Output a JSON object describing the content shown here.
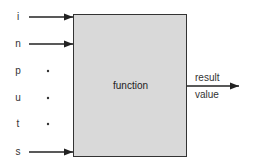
{
  "diagram": {
    "inputs": [
      {
        "label": "i",
        "y": 17,
        "arrow": true
      },
      {
        "label": "n",
        "y": 44,
        "arrow": true
      },
      {
        "label": "p",
        "y": 71,
        "arrow": false
      },
      {
        "label": "u",
        "y": 98,
        "arrow": false
      },
      {
        "label": "t",
        "y": 124,
        "arrow": false
      },
      {
        "label": "s",
        "y": 152,
        "arrow": true
      }
    ],
    "box_label": "function",
    "output": {
      "line1": "result",
      "line2": "value"
    },
    "colors": {
      "box_fill": "#d9d9d9",
      "stroke": "#222222"
    }
  }
}
